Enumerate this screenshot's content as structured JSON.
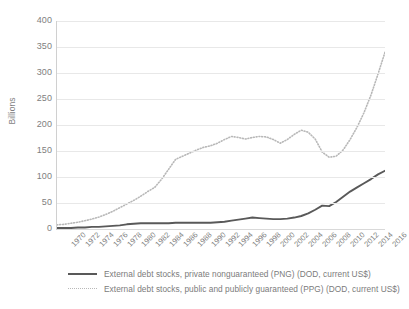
{
  "chart_data": {
    "type": "line",
    "title": "",
    "xlabel": "",
    "ylabel": "Billions",
    "ylim": [
      0,
      400
    ],
    "ytick_values": [
      0,
      50,
      100,
      150,
      200,
      250,
      300,
      350,
      400
    ],
    "ytick_labels": [
      "0",
      "50",
      "100",
      "150",
      "200",
      "250",
      "300",
      "350",
      "400"
    ],
    "xlim": [
      1970,
      2017
    ],
    "grid": "horizontal",
    "legend_position": "bottom",
    "x": [
      1970,
      1971,
      1972,
      1973,
      1974,
      1975,
      1976,
      1977,
      1978,
      1979,
      1980,
      1981,
      1982,
      1983,
      1984,
      1985,
      1986,
      1987,
      1988,
      1989,
      1990,
      1991,
      1992,
      1993,
      1994,
      1995,
      1996,
      1997,
      1998,
      1999,
      2000,
      2001,
      2002,
      2003,
      2004,
      2005,
      2006,
      2007,
      2008,
      2009,
      2010,
      2011,
      2012,
      2013,
      2014,
      2015,
      2016,
      2017
    ],
    "xtick_labels": [
      "1970",
      "1972",
      "1974",
      "1976",
      "1978",
      "1980",
      "1982",
      "1984",
      "1986",
      "1988",
      "1990",
      "1992",
      "1994",
      "1996",
      "1998",
      "2000",
      "2002",
      "2004",
      "2006",
      "2008",
      "2010",
      "2012",
      "2014",
      "2016"
    ],
    "series": [
      {
        "name": "External debt stocks, private nonguaranteed (PNG) (DOD, current US$)",
        "style": "solid",
        "color": "#595959",
        "values": [
          2,
          2,
          2,
          3,
          3,
          4,
          4,
          5,
          6,
          7,
          9,
          10,
          11,
          11,
          11,
          11,
          11,
          12,
          12,
          12,
          12,
          12,
          12,
          13,
          14,
          16,
          18,
          20,
          22,
          21,
          20,
          19,
          19,
          20,
          22,
          25,
          30,
          37,
          45,
          44,
          52,
          62,
          72,
          80,
          88,
          96,
          105,
          112
        ]
      },
      {
        "name": "External debt stocks, public and publicly guaranteed (PPG) (DOD, current US$)",
        "style": "dotted",
        "color": "#b8b8b8",
        "values": [
          8,
          9,
          11,
          13,
          16,
          19,
          23,
          28,
          34,
          41,
          48,
          55,
          63,
          72,
          80,
          96,
          115,
          134,
          140,
          146,
          152,
          157,
          160,
          165,
          172,
          178,
          176,
          173,
          176,
          178,
          177,
          172,
          165,
          172,
          182,
          190,
          186,
          173,
          148,
          138,
          140,
          152,
          172,
          196,
          224,
          258,
          298,
          340
        ]
      }
    ]
  },
  "legend": {
    "items": [
      {
        "label": "External debt stocks, private nonguaranteed (PNG) (DOD, current US$)",
        "swatch": "solid-line-swatch"
      },
      {
        "label": "External debt stocks, public and publicly guaranteed (PPG) (DOD, current US$)",
        "swatch": "dotted-line-swatch"
      }
    ]
  }
}
